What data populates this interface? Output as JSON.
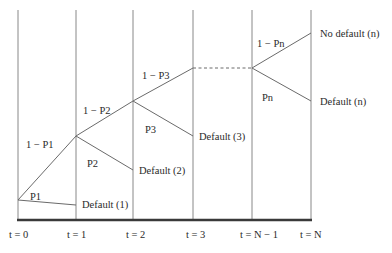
{
  "diagram": {
    "type": "default-probability-tree",
    "time_labels": [
      "t = 0",
      "t = 1",
      "t = 2",
      "t = 3",
      "t = N − 1",
      "t = N"
    ],
    "branches": [
      {
        "survive_label": "1 − P1",
        "default_prob_label": "P1",
        "default_outcome": "Default (1)"
      },
      {
        "survive_label": "1 − P2",
        "default_prob_label": "P2",
        "default_outcome": "Default (2)"
      },
      {
        "survive_label": "1 − P3",
        "default_prob_label": "P3",
        "default_outcome": "Default (3)"
      },
      {
        "survive_label": "1 − Pn",
        "default_prob_label": "Pn",
        "default_outcome": "Default (n)"
      }
    ],
    "final_survive_outcome": "No default (n)",
    "colors": {
      "line": "#5a5a5a",
      "axis": "#3a3a3a",
      "text": "#2a2a2a"
    }
  }
}
